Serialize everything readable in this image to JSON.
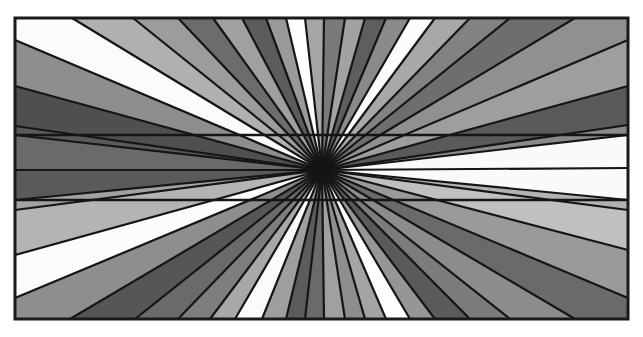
{
  "figure": {
    "canvas": {
      "width": 643,
      "height": 337,
      "background": "#ffffff"
    },
    "frame": {
      "x1": 15,
      "y1": 18,
      "x2": 628,
      "y2": 319,
      "stroke": "#1a1a1a",
      "stroke_width": 3
    },
    "center": {
      "x": 322,
      "y": 170
    },
    "ray_stroke": "#151515",
    "ray_stroke_width": 2.2,
    "horizontal_lines": [
      {
        "y": 135,
        "stroke_width": 2.6
      },
      {
        "y": 200,
        "stroke_width": 2.6
      }
    ],
    "boundary_points": [
      {
        "x": 15,
        "y": 170
      },
      {
        "x": 15,
        "y": 135
      },
      {
        "x": 15,
        "y": 126
      },
      {
        "x": 15,
        "y": 86
      },
      {
        "x": 15,
        "y": 40
      },
      {
        "x": 72,
        "y": 18
      },
      {
        "x": 133,
        "y": 18
      },
      {
        "x": 178,
        "y": 18
      },
      {
        "x": 213,
        "y": 18
      },
      {
        "x": 242,
        "y": 18
      },
      {
        "x": 266,
        "y": 18
      },
      {
        "x": 286,
        "y": 18
      },
      {
        "x": 305,
        "y": 18
      },
      {
        "x": 324,
        "y": 18
      },
      {
        "x": 345,
        "y": 18
      },
      {
        "x": 365,
        "y": 18
      },
      {
        "x": 386,
        "y": 18
      },
      {
        "x": 410,
        "y": 18
      },
      {
        "x": 435,
        "y": 18
      },
      {
        "x": 470,
        "y": 18
      },
      {
        "x": 510,
        "y": 18
      },
      {
        "x": 575,
        "y": 18
      },
      {
        "x": 628,
        "y": 40
      },
      {
        "x": 628,
        "y": 86
      },
      {
        "x": 628,
        "y": 125
      },
      {
        "x": 628,
        "y": 135
      },
      {
        "x": 628,
        "y": 168
      },
      {
        "x": 628,
        "y": 200
      },
      {
        "x": 628,
        "y": 210
      },
      {
        "x": 628,
        "y": 250
      },
      {
        "x": 628,
        "y": 298
      },
      {
        "x": 575,
        "y": 319
      },
      {
        "x": 510,
        "y": 319
      },
      {
        "x": 470,
        "y": 319
      },
      {
        "x": 435,
        "y": 319
      },
      {
        "x": 410,
        "y": 319
      },
      {
        "x": 386,
        "y": 319
      },
      {
        "x": 365,
        "y": 319
      },
      {
        "x": 345,
        "y": 319
      },
      {
        "x": 324,
        "y": 319
      },
      {
        "x": 305,
        "y": 319
      },
      {
        "x": 286,
        "y": 319
      },
      {
        "x": 262,
        "y": 319
      },
      {
        "x": 235,
        "y": 319
      },
      {
        "x": 210,
        "y": 319
      },
      {
        "x": 178,
        "y": 319
      },
      {
        "x": 135,
        "y": 319
      },
      {
        "x": 70,
        "y": 319
      },
      {
        "x": 15,
        "y": 298
      },
      {
        "x": 15,
        "y": 255
      },
      {
        "x": 15,
        "y": 210
      },
      {
        "x": 15,
        "y": 200
      }
    ],
    "wedge_fills": [
      "#6a6a6a",
      "#5a5a5a",
      "#4f4f4f",
      "#8e8e8e",
      "#fbfbfb",
      "#b0b0b0",
      "#9c9c9c",
      "#6c6c6c",
      "#a0a0a0",
      "#5c5c5c",
      "#9a9a9a",
      "#fdfdfd",
      "#a6a6a6",
      "#7a7a7a",
      "#a2a2a2",
      "#5e5e5e",
      "#8a8a8a",
      "#fcfcfc",
      "#a8a8a8",
      "#828282",
      "#6e6e6e",
      "#909090",
      "#9e9e9e",
      "#5a5a5a",
      "#8a8a8a",
      "#fafafa",
      "#fafafa",
      "#b2b2b2",
      "#c0c0c0",
      "#9a9a9a",
      "#6a6a6a",
      "#8c8c8c",
      "#7c7c7c",
      "#5a5a5a",
      "#969696",
      "#fdfdfd",
      "#a4a4a4",
      "#8e8e8e",
      "#a0a0a0",
      "#6a6a6a",
      "#5c5c5c",
      "#9e9e9e",
      "#fbfbfb",
      "#a8a8a8",
      "#7e7e7e",
      "#6a6a6a",
      "#565656",
      "#8e8e8e",
      "#fcfcfc",
      "#b4b4b4",
      "#a2a2a2",
      "#5a5a5a"
    ]
  }
}
